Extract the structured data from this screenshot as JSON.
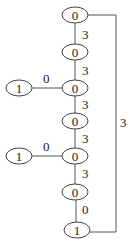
{
  "diagram": {
    "type": "tree-graph",
    "nodes": [
      {
        "id": "n1",
        "label": "0",
        "x": 75,
        "y": 15
      },
      {
        "id": "n2",
        "label": "0",
        "x": 75,
        "y": 52
      },
      {
        "id": "n3",
        "label": "0",
        "x": 75,
        "y": 88
      },
      {
        "id": "n4",
        "label": "0",
        "x": 75,
        "y": 121
      },
      {
        "id": "n5",
        "label": "0",
        "x": 75,
        "y": 156
      },
      {
        "id": "n6",
        "label": "0",
        "x": 75,
        "y": 192
      },
      {
        "id": "n7",
        "label": "1",
        "x": 77,
        "y": 230
      },
      {
        "id": "l1",
        "label": "1",
        "x": 19,
        "y": 88
      },
      {
        "id": "l2",
        "label": "1",
        "x": 19,
        "y": 156
      }
    ],
    "edges": [
      {
        "from": "n1",
        "to": "n2",
        "label": "3"
      },
      {
        "from": "n2",
        "to": "n3",
        "label": "3"
      },
      {
        "from": "l1",
        "to": "n3",
        "label": "0"
      },
      {
        "from": "n3",
        "to": "n4",
        "label": "3"
      },
      {
        "from": "n4",
        "to": "n5",
        "label": "3"
      },
      {
        "from": "l2",
        "to": "n5",
        "label": "0"
      },
      {
        "from": "n5",
        "to": "n6",
        "label": "3"
      },
      {
        "from": "n6",
        "to": "n7",
        "label": "0"
      },
      {
        "from": "n1",
        "to": "n7",
        "label": "3"
      }
    ]
  }
}
